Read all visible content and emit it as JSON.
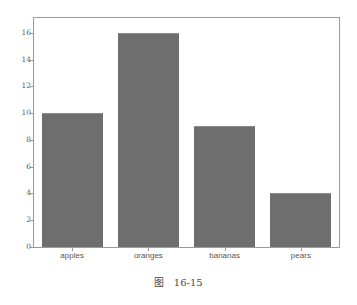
{
  "figure": {
    "background_color": "#ffffff",
    "caption_label": "图",
    "caption_number": "16-15"
  },
  "chart_data": {
    "type": "bar",
    "title": "",
    "xlabel": "",
    "ylabel": "",
    "categories": [
      "apples",
      "oranges",
      "bananas",
      "pears"
    ],
    "values": [
      10,
      16,
      9,
      4
    ],
    "ylim": [
      0,
      17.1
    ],
    "yticks": [
      0,
      2,
      4,
      6,
      8,
      10,
      12,
      14,
      16
    ],
    "ytick_labels": [
      "0",
      "2",
      "4",
      "6",
      "8",
      "10",
      "12",
      "14",
      "16"
    ],
    "bar_color": "#6e6e6e",
    "bar_width_ratio": 0.8,
    "grid": false,
    "legend": false,
    "frame": true,
    "axis_color": "#9a9a9a"
  }
}
